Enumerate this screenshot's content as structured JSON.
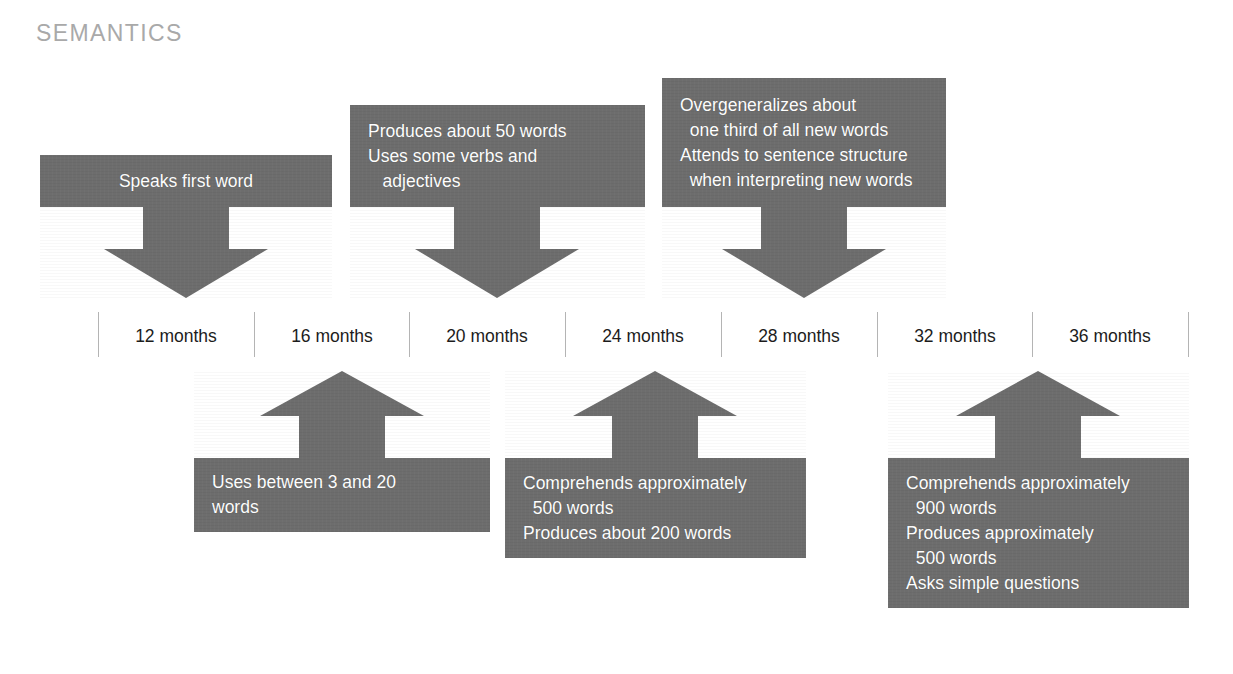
{
  "page": {
    "title": "SEMANTICS",
    "background_color": "#ffffff",
    "box_fill_color": "#6d6d6d",
    "box_text_color": "#ffffff",
    "title_color": "#a9a9a9",
    "axis_tick_color": "#b4b4b4",
    "axis_label_color": "#1c1c1c"
  },
  "timeline": {
    "ticks": [
      {
        "label": "12 months"
      },
      {
        "label": "16 months"
      },
      {
        "label": "20 months"
      },
      {
        "label": "24 months"
      },
      {
        "label": "28 months"
      },
      {
        "label": "32 months"
      },
      {
        "label": "36 months"
      }
    ]
  },
  "milestones_above": [
    {
      "id": "speaks-first-word",
      "align": "center",
      "lines": [
        "Speaks first word"
      ],
      "points_to": "12 months"
    },
    {
      "id": "produces-50-words",
      "align": "left",
      "lines": [
        "Produces about 50 words",
        "Uses some verbs and",
        "   adjectives"
      ],
      "points_to": "20 months"
    },
    {
      "id": "overgeneralizes",
      "align": "left",
      "lines": [
        "Overgeneralizes about",
        "  one third of all new words",
        "Attends to sentence structure",
        "  when interpreting new words"
      ],
      "points_to": "28 months"
    }
  ],
  "milestones_below": [
    {
      "id": "uses-3-to-20-words",
      "align": "left",
      "lines": [
        "Uses between 3 and 20",
        "words"
      ],
      "points_to": "16 months"
    },
    {
      "id": "comprehends-500-words",
      "align": "left",
      "lines": [
        "Comprehends approximately",
        "  500 words",
        "Produces about 200 words"
      ],
      "points_to": "24 months"
    },
    {
      "id": "comprehends-900-words",
      "align": "left",
      "lines": [
        "Comprehends approximately",
        "  900 words",
        "Produces approximately",
        "  500 words",
        "Asks simple questions"
      ],
      "points_to": "32 months"
    }
  ]
}
